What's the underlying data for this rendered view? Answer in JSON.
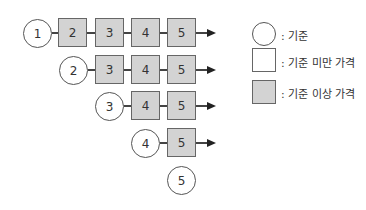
{
  "diagram": {
    "rows": [
      {
        "start": "1",
        "boxes": [
          "2",
          "3",
          "4",
          "5"
        ],
        "arrow": true
      },
      {
        "start": "2",
        "boxes": [
          "3",
          "4",
          "5"
        ],
        "arrow": true
      },
      {
        "start": "3",
        "boxes": [
          "4",
          "5"
        ],
        "arrow": true
      },
      {
        "start": "4",
        "boxes": [
          "5"
        ],
        "arrow": true
      },
      {
        "start": "5",
        "boxes": [],
        "arrow": false
      }
    ]
  },
  "legend": {
    "items": [
      {
        "shape": "circle",
        "label": ": 기준"
      },
      {
        "shape": "white-square",
        "label": ": 기준 미만 가격"
      },
      {
        "shape": "gray-square",
        "label": ": 기준 이상 가격"
      }
    ]
  },
  "colors": {
    "box_fill": "#d3d3d3",
    "stroke": "#555555"
  }
}
